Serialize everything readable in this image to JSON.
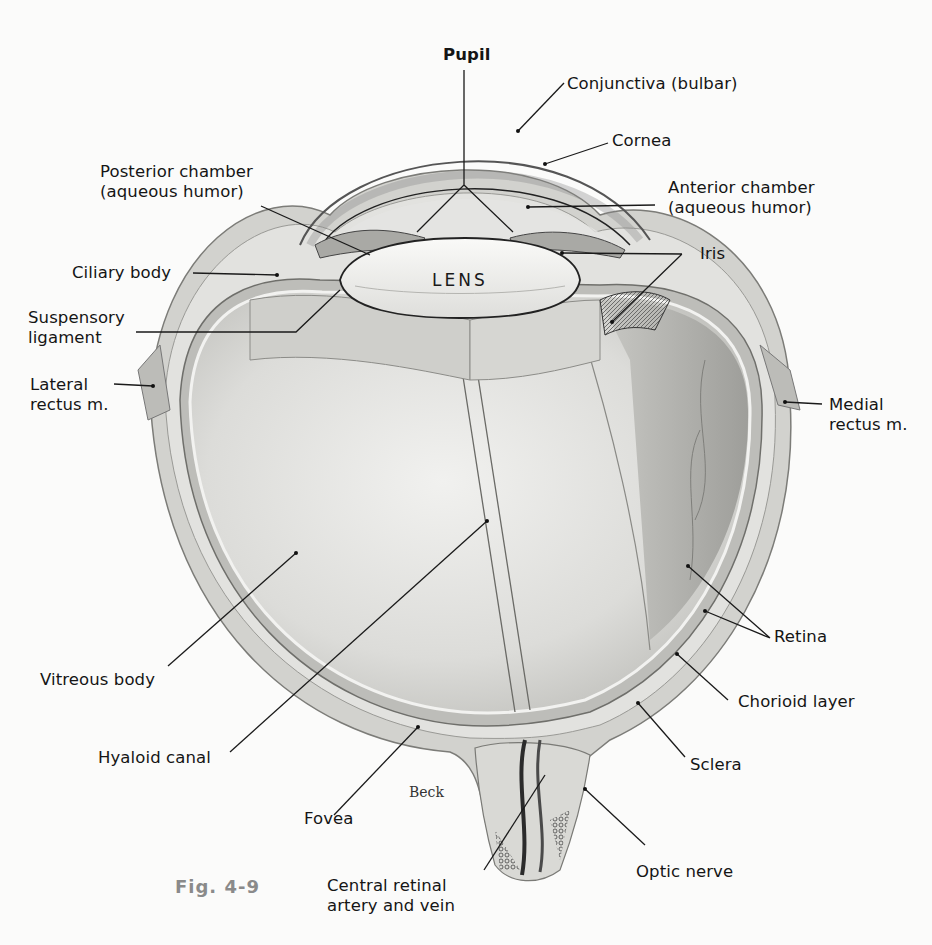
{
  "figure": {
    "caption": "Fig.  4-9",
    "artist_signature": "Beck",
    "lens_label": "LENS",
    "colors": {
      "background": "#fbfbfa",
      "line": "#1a1a1a",
      "tissue_light": "#e4e4e2",
      "tissue_mid": "#c9c9c6",
      "tissue_dark": "#8f8f8c",
      "caption_gray": "#8a8a8a"
    }
  },
  "labels": {
    "pupil": "Pupil",
    "conjunctiva": "Conjunctiva (bulbar)",
    "cornea": "Cornea",
    "posterior_chamber_1": "Posterior chamber",
    "posterior_chamber_2": "(aqueous humor)",
    "anterior_chamber_1": "Anterior chamber",
    "anterior_chamber_2": "(aqueous humor)",
    "iris": "Iris",
    "ciliary_body": "Ciliary body",
    "suspensory_1": "Suspensory",
    "suspensory_2": "ligament",
    "lateral_rectus_1": "Lateral",
    "lateral_rectus_2": "rectus m.",
    "medial_rectus_1": "Medial",
    "medial_rectus_2": "rectus m.",
    "vitreous_body": "Vitreous body",
    "hyaloid_canal": "Hyaloid canal",
    "retina": "Retina",
    "chorioid_layer": "Chorioid layer",
    "sclera": "Sclera",
    "fovea": "Fovea",
    "optic_nerve": "Optic nerve",
    "central_retinal_1": "Central retinal",
    "central_retinal_2": "artery and vein"
  }
}
